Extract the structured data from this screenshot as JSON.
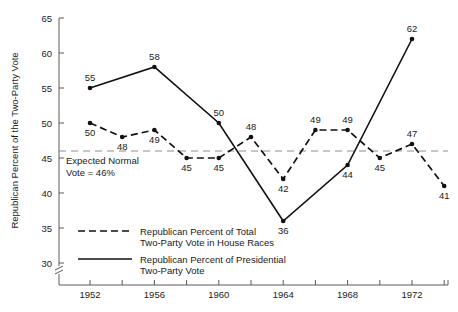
{
  "chart_data": {
    "type": "line",
    "title": "",
    "xlabel": "",
    "ylabel": "Republican Percent of the Two-Party Vote",
    "ylim": [
      30,
      65
    ],
    "yticks": [
      30,
      35,
      40,
      45,
      50,
      55,
      60,
      65
    ],
    "ytick_labels": [
      "30",
      "35",
      "40",
      "45",
      "50",
      "55",
      "60",
      "65"
    ],
    "xlim": [
      1951,
      1975
    ],
    "xticks": [
      1952,
      1954,
      1956,
      1958,
      1960,
      1962,
      1964,
      1966,
      1968,
      1970,
      1972,
      1974
    ],
    "xtick_labels": [
      "1952",
      "1956",
      "1960",
      "1964",
      "1968",
      "1972"
    ],
    "labeled_xticks": [
      1952,
      1956,
      1960,
      1964,
      1968,
      1972
    ],
    "grid": false,
    "axis_break": true,
    "legend_position": "lower-left-inside",
    "reference_line": {
      "value": 46,
      "style": "dashed",
      "label_line1": "Expected Normal",
      "label_line2": "Vote = 46%"
    },
    "series": [
      {
        "name": "Republican Percent of Total Two-Party Vote in House Races",
        "legend_line1": "Republican Percent of Total",
        "legend_line2": "Two-Party Vote in House Races",
        "style": "dashed",
        "x": [
          1952,
          1954,
          1956,
          1958,
          1960,
          1962,
          1964,
          1966,
          1968,
          1970,
          1972,
          1974
        ],
        "values": [
          50,
          48,
          49,
          45,
          45,
          48,
          42,
          49,
          49,
          45,
          47,
          41
        ],
        "label_positions": [
          "below",
          "below",
          "below",
          "below",
          "below",
          "above",
          "below",
          "above",
          "above",
          "below",
          "above",
          "below"
        ]
      },
      {
        "name": "Republican Percent of Presidential Two-Party Vote",
        "legend_line1": "Republican Percent of Presidential",
        "legend_line2": "Two-Party Vote",
        "style": "solid",
        "x": [
          1952,
          1956,
          1960,
          1964,
          1968,
          1972
        ],
        "values": [
          55,
          58,
          50,
          36,
          44,
          62
        ],
        "label_positions": [
          "above",
          "above",
          "above",
          "below",
          "below",
          "above"
        ]
      }
    ]
  }
}
